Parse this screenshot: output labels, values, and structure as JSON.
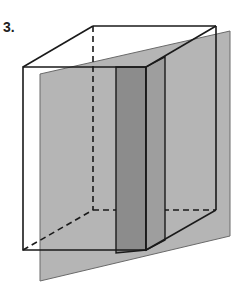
{
  "problem": {
    "number_label": "3."
  },
  "figure": {
    "colors": {
      "edge": "#1a1a1a",
      "plane": "#b5b5b5",
      "plane_edge": "#6a6a6a",
      "cross_section_front": "#8c8c8c",
      "cross_section_side": "#9e9e9e"
    }
  }
}
